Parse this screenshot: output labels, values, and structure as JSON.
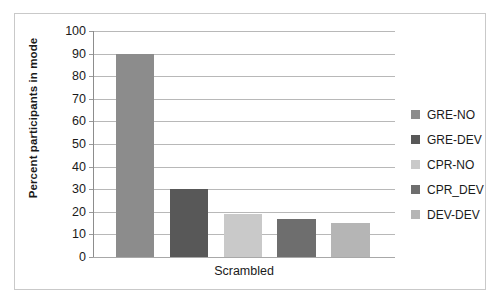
{
  "chart_data": {
    "type": "bar",
    "title": "",
    "xlabel": "",
    "ylabel": "Percent participants in mode",
    "categories": [
      "Scrambled"
    ],
    "x": [
      "Scrambled"
    ],
    "ylim": [
      0,
      100
    ],
    "ytick_values": [
      0,
      10,
      20,
      30,
      40,
      50,
      60,
      70,
      80,
      90,
      100
    ],
    "ytick_labels": [
      "0",
      "10",
      "20",
      "30",
      "40",
      "50",
      "60",
      "70",
      "80",
      "90",
      "100"
    ],
    "grid": true,
    "legend_position": "right",
    "series": [
      {
        "name": "GRE-NO",
        "values": [
          90
        ],
        "color": "#8c8c8c"
      },
      {
        "name": "GRE-DEV",
        "values": [
          30
        ],
        "color": "#585858"
      },
      {
        "name": "CPR-NO",
        "values": [
          19
        ],
        "color": "#c9c9c9"
      },
      {
        "name": "CPR_DEV",
        "values": [
          17
        ],
        "color": "#6e6e6e"
      },
      {
        "name": "DEV-DEV",
        "values": [
          15
        ],
        "color": "#b5b5b5"
      }
    ]
  },
  "legend": {
    "items": [
      {
        "label": "GRE-NO",
        "color": "#8c8c8c"
      },
      {
        "label": "GRE-DEV",
        "color": "#585858"
      },
      {
        "label": "CPR-NO",
        "color": "#c9c9c9"
      },
      {
        "label": "CPR_DEV",
        "color": "#6e6e6e"
      },
      {
        "label": "DEV-DEV",
        "color": "#b5b5b5"
      }
    ]
  },
  "axes": {
    "y_title": "Percent participants in mode",
    "x_category": "Scrambled"
  }
}
